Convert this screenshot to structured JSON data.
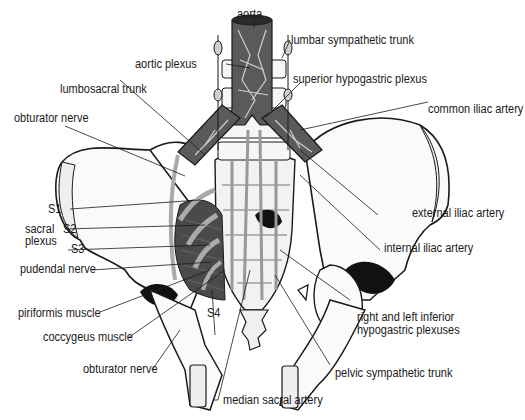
{
  "figure": {
    "colors": {
      "line": "#1a1a1a",
      "bone_fill": "#fafafa",
      "vessel_fill": "#5a5a5a",
      "muscle_fill": "#4a4a4a",
      "nerve_fill": "#b8b8b8",
      "shadow": "#111111"
    }
  },
  "labels": {
    "aorta": "aorta",
    "lumbar_sympathetic_trunk": "lumbar sympathetic trunk",
    "aortic_plexus": "aortic plexus",
    "superior_hypogastric_plexus": "superior hypogastric plexus",
    "lumbosacral_trunk": "lumbosacral trunk",
    "common_iliac_artery": "common iliac artery",
    "obturator_nerve_top": "obturator nerve",
    "s1": "S1",
    "s2": "S2",
    "s3": "S3",
    "s4": "S4",
    "sacral_plexus_line1": "sacral",
    "sacral_plexus_line2": "plexus",
    "pudendal_nerve": "pudendal nerve",
    "external_iliac_artery": "external iliac artery",
    "internal_iliac_artery": "internal iliac artery",
    "piriformis_muscle": "piriformis muscle",
    "coccygeus_muscle": "coccygeus muscle",
    "obturator_nerve_bottom": "obturator nerve",
    "inferior_hypogastric_line1": "right and left inferior",
    "inferior_hypogastric_line2": "hypogastric plexuses",
    "pelvic_sympathetic_trunk": "pelvic sympathetic trunk",
    "median_sacral_artery": "median sacral artery"
  }
}
